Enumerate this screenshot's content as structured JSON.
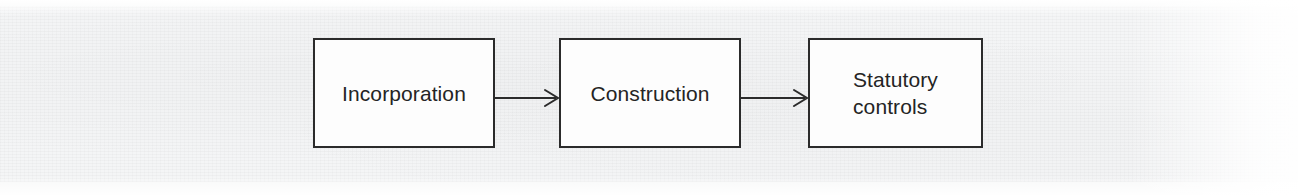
{
  "diagram": {
    "type": "process-flow",
    "orientation": "left-to-right",
    "background_color": "#f4f5f6",
    "stroke_color": "#2b2b2b",
    "text_color": "#242424",
    "nodes": [
      {
        "id": "incorporation",
        "label": "Incorporation",
        "shape": "rectangle",
        "align": "center"
      },
      {
        "id": "construction",
        "label": "Construction",
        "shape": "rectangle",
        "align": "center"
      },
      {
        "id": "statutory-controls",
        "label": "Statutory\ncontrols",
        "shape": "rectangle",
        "align": "left"
      }
    ],
    "connectors": [
      {
        "id": "arrow-1",
        "from": "incorporation",
        "to": "construction",
        "style": "solid",
        "arrowhead": "open"
      },
      {
        "id": "arrow-2",
        "from": "construction",
        "to": "statutory-controls",
        "style": "solid",
        "arrowhead": "open"
      }
    ]
  }
}
